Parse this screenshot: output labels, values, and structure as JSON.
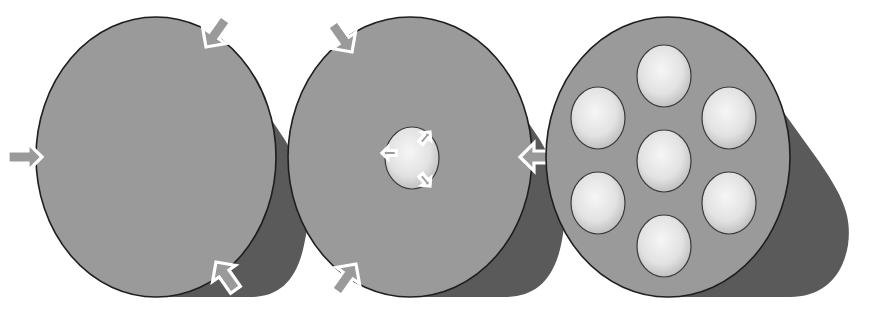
{
  "diagram": {
    "colors": {
      "background": "#ffffff",
      "face": "#9a9a9a",
      "body": "#5a5a5a",
      "outline": "#1e1e1e",
      "hole_light": "#f2f2f2",
      "hole_dark": "#b8b8b8",
      "arrow_fill": "#9a9a9a",
      "arrow_stroke": "#ffffff"
    },
    "cylinders": [
      {
        "id": "solid-cylinder",
        "face": {
          "cx": 156,
          "cy": 157,
          "rx": 120,
          "ry": 140
        },
        "arrows": [
          {
            "name": "arrow-left-inward",
            "x": 42,
            "y": 157,
            "angle": 0
          },
          {
            "name": "arrow-top-right-inward",
            "x": 206,
            "y": 47,
            "angle": 125
          },
          {
            "name": "arrow-bottom-right-inward",
            "x": 216,
            "y": 262,
            "angle": -125
          }
        ],
        "holes": []
      },
      {
        "id": "hollow-cylinder",
        "face": {
          "cx": 410,
          "cy": 157,
          "rx": 122,
          "ry": 140
        },
        "arrows": [
          {
            "name": "arrow-top-left-inward",
            "x": 352,
            "y": 52,
            "angle": 55
          },
          {
            "name": "arrow-right-inward",
            "x": 520,
            "y": 157,
            "angle": 180
          },
          {
            "name": "arrow-bottom-left-inward",
            "x": 356,
            "y": 264,
            "angle": -55
          }
        ],
        "holes": [
          {
            "cx": 412,
            "cy": 158,
            "rx": 27,
            "ry": 31
          }
        ],
        "inner_arrows": [
          {
            "name": "inner-arrow-left-outward",
            "x": 382,
            "y": 153,
            "angle": 180
          },
          {
            "name": "inner-arrow-top-right-outward",
            "x": 430,
            "y": 132,
            "angle": -50
          },
          {
            "name": "inner-arrow-bottom-right-outward",
            "x": 430,
            "y": 186,
            "angle": 50
          }
        ]
      },
      {
        "id": "multi-hole-cylinder",
        "face": {
          "cx": 668,
          "cy": 157,
          "rx": 122,
          "ry": 140
        },
        "arrows": [],
        "holes": [
          {
            "cx": 664,
            "cy": 76,
            "rx": 27,
            "ry": 31
          },
          {
            "cx": 598,
            "cy": 118,
            "rx": 27,
            "ry": 31
          },
          {
            "cx": 729,
            "cy": 118,
            "rx": 27,
            "ry": 31
          },
          {
            "cx": 664,
            "cy": 161,
            "rx": 27,
            "ry": 31
          },
          {
            "cx": 598,
            "cy": 203,
            "rx": 27,
            "ry": 31
          },
          {
            "cx": 729,
            "cy": 203,
            "rx": 27,
            "ry": 31
          },
          {
            "cx": 664,
            "cy": 246,
            "rx": 27,
            "ry": 31
          }
        ]
      }
    ]
  }
}
